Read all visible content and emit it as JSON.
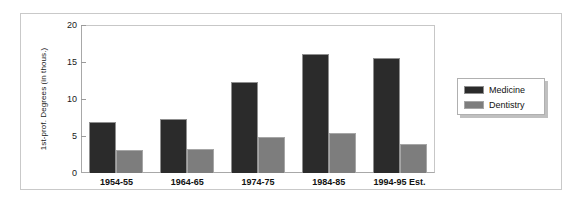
{
  "chart_data": {
    "type": "bar",
    "title": "",
    "xlabel": "",
    "ylabel": "1st-prof. Degrees (in thous.)",
    "ylim": [
      0,
      20
    ],
    "yticks": [
      "0",
      "5",
      "10",
      "15",
      "20"
    ],
    "grid": false,
    "legend_position": "right",
    "categories": [
      "1954-55",
      "1964-65",
      "1974-75",
      "1984-85",
      "1994-95 Est."
    ],
    "series": [
      {
        "name": "Medicine",
        "color": "#2b2b2b",
        "values": [
          6.9,
          7.3,
          12.3,
          16.1,
          15.6
        ]
      },
      {
        "name": "Dentistry",
        "color": "#7d7d7d",
        "values": [
          3.1,
          3.2,
          4.9,
          5.4,
          3.9
        ]
      }
    ]
  },
  "legend": {
    "entries": [
      {
        "label": "Medicine",
        "swatch": "medicine-swatch"
      },
      {
        "label": "Dentistry",
        "swatch": "dentistry-swatch"
      }
    ]
  }
}
